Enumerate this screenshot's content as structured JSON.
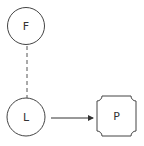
{
  "diagram": {
    "nodes": [
      {
        "id": "F",
        "label": "F",
        "shape": "circle"
      },
      {
        "id": "L",
        "label": "L",
        "shape": "circle"
      },
      {
        "id": "P",
        "label": "P",
        "shape": "notched-rectangle"
      }
    ],
    "edges": [
      {
        "from": "F",
        "to": "L",
        "style": "dashed",
        "arrow": false
      },
      {
        "from": "L",
        "to": "P",
        "style": "solid",
        "arrow": true
      }
    ]
  },
  "colors": {
    "stroke": "#444444",
    "text": "#333333",
    "background": "#ffffff"
  }
}
